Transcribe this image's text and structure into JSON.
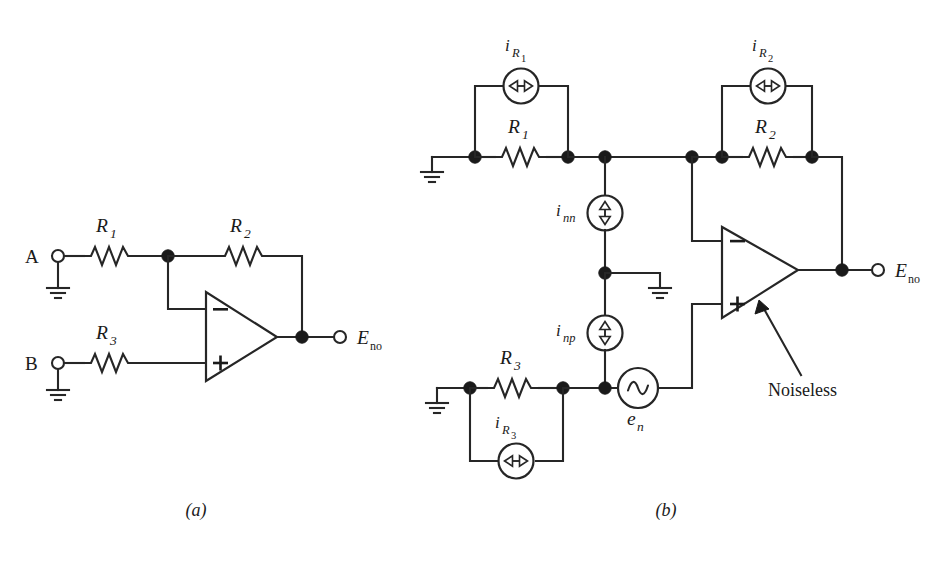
{
  "figure": {
    "background_color": "#ffffff",
    "ink_color": "#262626",
    "width": 942,
    "height": 561,
    "captions": [
      {
        "id": "caption-a",
        "text": "(a)",
        "x": 196,
        "y": 516
      },
      {
        "id": "caption-b",
        "text": "(b)",
        "x": 666,
        "y": 516
      }
    ]
  },
  "circuit_a": {
    "name": "Ideal summing/difference amplifier",
    "input_terminals": [
      {
        "label": "A",
        "name": "input-terminal-a"
      },
      {
        "label": "B",
        "name": "input-terminal-b"
      }
    ],
    "resistors": [
      {
        "symbol": "R",
        "subscript": "1",
        "name": "resistor-r1"
      },
      {
        "symbol": "R",
        "subscript": "2",
        "name": "resistor-r2"
      },
      {
        "symbol": "R",
        "subscript": "3",
        "name": "resistor-r3"
      }
    ],
    "opamp": {
      "name": "opamp-a",
      "inverting_pin": "−",
      "noninverting_pin": "+"
    },
    "output": {
      "symbol": "E",
      "subscript": "no",
      "name": "output-terminal-eno"
    },
    "grounds": 2
  },
  "circuit_b": {
    "name": "Noise model with noiseless op-amp and noise sources",
    "resistors": [
      {
        "symbol": "R",
        "subscript": "1",
        "name": "resistor-r1"
      },
      {
        "symbol": "R",
        "subscript": "2",
        "name": "resistor-r2"
      },
      {
        "symbol": "R",
        "subscript": "3",
        "name": "resistor-r3"
      }
    ],
    "current_sources": [
      {
        "symbol": "i",
        "subscript": "R",
        "subsubscript": "1",
        "orientation": "horizontal",
        "name": "current-source-ir1"
      },
      {
        "symbol": "i",
        "subscript": "R",
        "subsubscript": "2",
        "orientation": "horizontal",
        "name": "current-source-ir2"
      },
      {
        "symbol": "i",
        "subscript": "R",
        "subsubscript": "3",
        "orientation": "horizontal",
        "name": "current-source-ir3"
      },
      {
        "symbol": "i",
        "subscript": "nn",
        "orientation": "vertical",
        "name": "current-source-inn"
      },
      {
        "symbol": "i",
        "subscript": "np",
        "orientation": "vertical",
        "name": "current-source-inp"
      }
    ],
    "voltage_sources": [
      {
        "symbol": "e",
        "subscript": "n",
        "kind": "ac",
        "name": "voltage-source-en"
      }
    ],
    "opamp": {
      "name": "opamp-b",
      "inverting_pin": "−",
      "noninverting_pin": "+",
      "annotation": "Noiseless",
      "annotation_name": "noiseless-annotation"
    },
    "output": {
      "symbol": "E",
      "subscript": "no",
      "name": "output-terminal-eno"
    },
    "grounds": 3
  }
}
